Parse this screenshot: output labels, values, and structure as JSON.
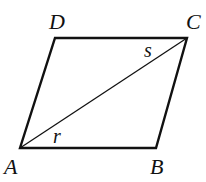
{
  "diagram": {
    "type": "parallelogram",
    "vertices": {
      "A": {
        "label": "A",
        "x": 20,
        "y": 148
      },
      "B": {
        "label": "B",
        "x": 156,
        "y": 148
      },
      "C": {
        "label": "C",
        "x": 187,
        "y": 38
      },
      "D": {
        "label": "D",
        "x": 55,
        "y": 38
      }
    },
    "diagonal": {
      "from": "A",
      "to": "C"
    },
    "angles": {
      "r": {
        "label": "r",
        "at": "A"
      },
      "s": {
        "label": "s",
        "at": "C"
      }
    },
    "stroke_color": "#111111"
  }
}
